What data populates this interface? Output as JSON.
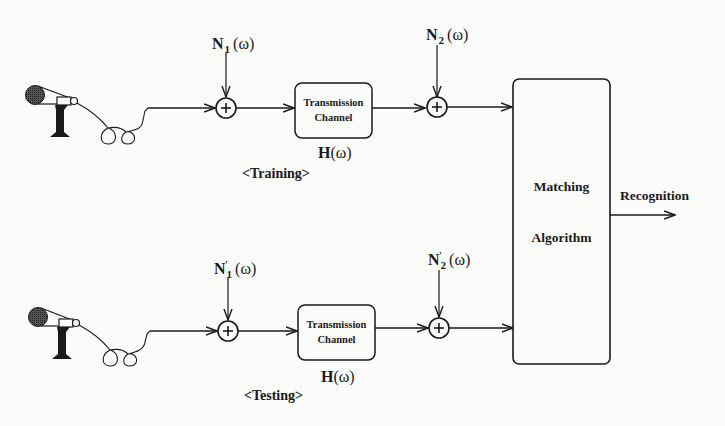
{
  "diagram": {
    "type": "block-diagram",
    "colors": {
      "stroke": "#1a1a1a",
      "background": "#fbfbfa",
      "mic_head": "#333333"
    },
    "rows": [
      {
        "phase_label": "<Training>",
        "source": "microphone",
        "noise_1": {
          "symbol": "N",
          "subscript": "1",
          "prime": "",
          "arg": "(ω)"
        },
        "channel": {
          "line1": "Transmission",
          "line2": "Channel",
          "transfer": "H",
          "transfer_arg": "(ω)"
        },
        "noise_2": {
          "symbol": "N",
          "subscript": "2",
          "prime": "",
          "arg": "(ω)"
        },
        "sum_symbol": "+"
      },
      {
        "phase_label": "<Testing>",
        "source": "microphone",
        "noise_1": {
          "symbol": "N",
          "subscript": "1",
          "prime": "'",
          "arg": "(ω)"
        },
        "channel": {
          "line1": "Transmission",
          "line2": "Channel",
          "transfer": "H",
          "transfer_arg": "(ω)"
        },
        "noise_2": {
          "symbol": "N",
          "subscript": "2",
          "prime": "'",
          "arg": "(ω)"
        },
        "sum_symbol": "+"
      }
    ],
    "matcher": {
      "line1": "Matching",
      "line2": "Algorithm"
    },
    "output": {
      "label": "Recognition"
    }
  }
}
